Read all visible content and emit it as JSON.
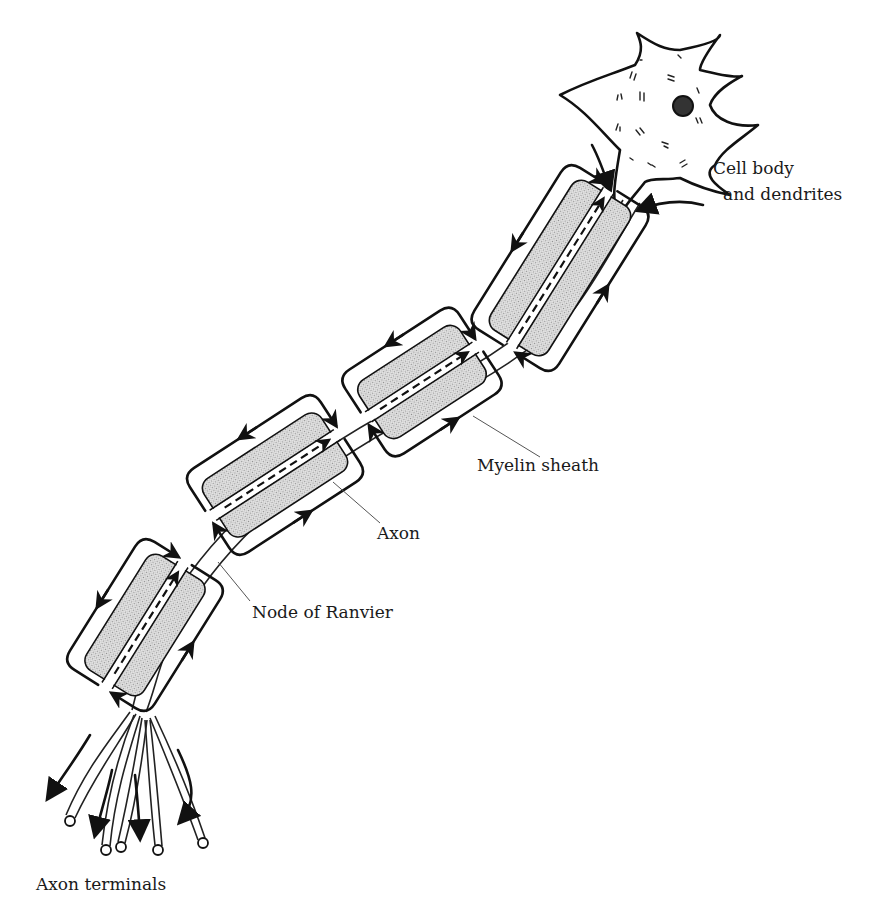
{
  "diagram": {
    "labels": {
      "cell_body": [
        "Cell body",
        "and dendrites"
      ],
      "myelin": "Myelin sheath",
      "axon": "Axon",
      "node": "Node of Ranvier",
      "terminals": "Axon terminals"
    },
    "segment_count": 4,
    "terminal_count": 5,
    "colors": {
      "ink": "#111111",
      "myelin_fill": "#cfcfcf",
      "background": "#ffffff"
    }
  }
}
